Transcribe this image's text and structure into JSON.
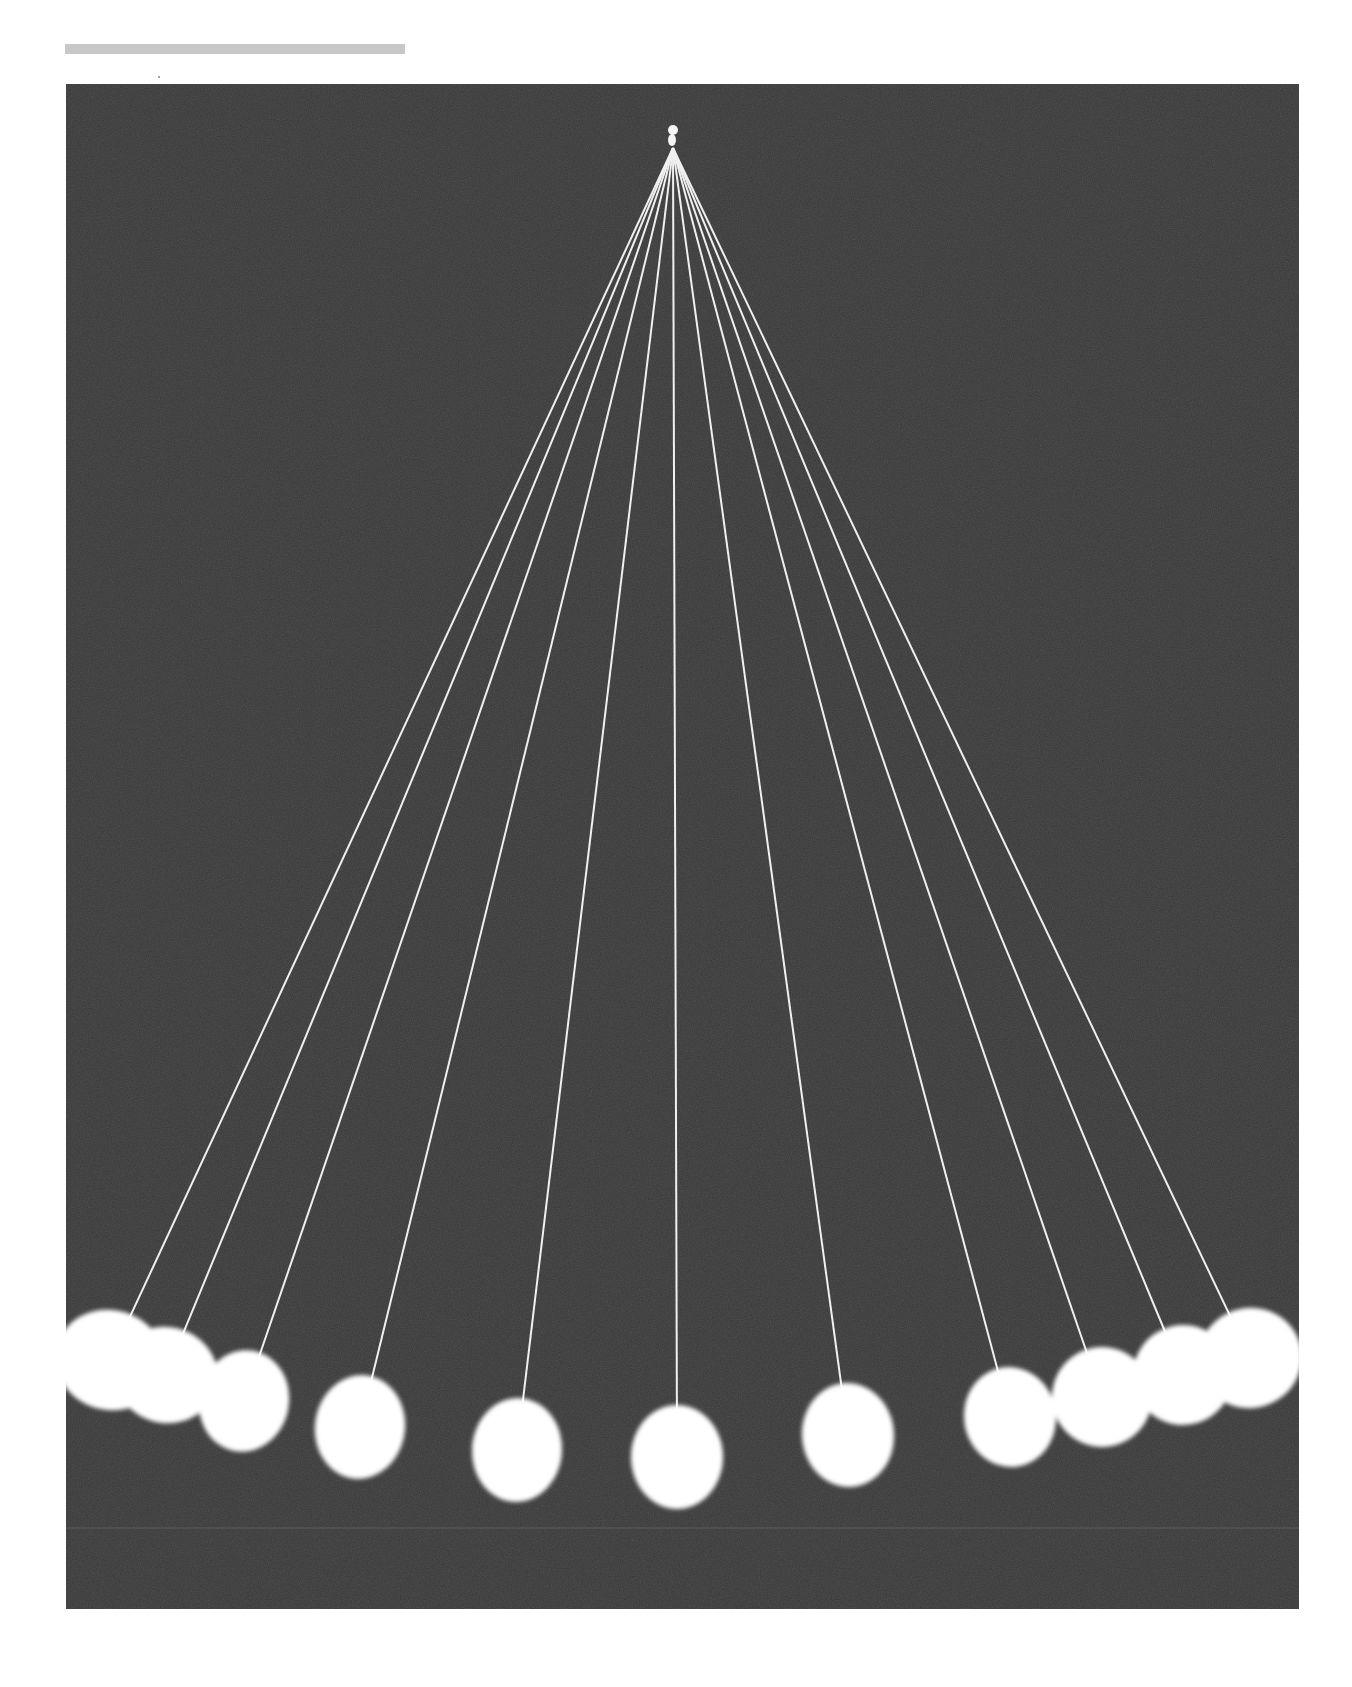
{
  "page": {
    "header_bar": {
      "color": "#c8c8c8"
    },
    "photo": {
      "subject": "pendulum wave",
      "background_color": "#383838",
      "string_color": "#f0f0f0",
      "ball_color": "#ffffff",
      "apex": {
        "x": 607,
        "y": 56
      },
      "balls": [
        {
          "cx": 44,
          "cy": 1276,
          "rx": 55,
          "ry": 50
        },
        {
          "cx": 100,
          "cy": 1291,
          "rx": 52,
          "ry": 48
        },
        {
          "cx": 178,
          "cy": 1317,
          "rx": 45,
          "ry": 51
        },
        {
          "cx": 294,
          "cy": 1343,
          "rx": 45,
          "ry": 52
        },
        {
          "cx": 451,
          "cy": 1366,
          "rx": 45,
          "ry": 52
        },
        {
          "cx": 611,
          "cy": 1373,
          "rx": 46,
          "ry": 52
        },
        {
          "cx": 782,
          "cy": 1351,
          "rx": 46,
          "ry": 52
        },
        {
          "cx": 944,
          "cy": 1333,
          "rx": 46,
          "ry": 50
        },
        {
          "cx": 1036,
          "cy": 1313,
          "rx": 50,
          "ry": 50
        },
        {
          "cx": 1117,
          "cy": 1291,
          "rx": 50,
          "ry": 50
        },
        {
          "cx": 1184,
          "cy": 1274,
          "rx": 52,
          "ry": 50
        }
      ],
      "horizon_line_y": 1444
    }
  }
}
